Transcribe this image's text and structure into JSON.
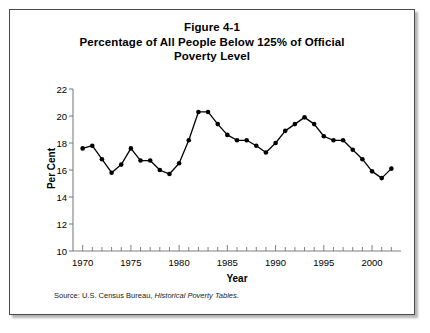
{
  "figure": {
    "title_lines": [
      "Figure 4-1",
      "Percentage of All People Below 125% of Official",
      "Poverty Level"
    ],
    "source_prefix": "Source: U.S. Census Bureau,",
    "source_italic": "Historical Poverty Tables",
    "source_suffix": "."
  },
  "chart_data": {
    "type": "line",
    "title": "Figure 4-1 Percentage of All People Below 125% of Official Poverty Level",
    "xlabel": "Year",
    "ylabel": "Per Cent",
    "xlim": [
      1969,
      2003
    ],
    "ylim": [
      10,
      22
    ],
    "ytick_step": 2,
    "yticks": [
      10,
      12,
      14,
      16,
      18,
      20,
      22
    ],
    "ytick_labels": [
      "10",
      "12",
      "14",
      "16",
      "18",
      "20",
      "22"
    ],
    "xticks_major": [
      1970,
      1975,
      1980,
      1985,
      1990,
      1995,
      2000
    ],
    "xtick_labels": [
      "1970",
      "1975",
      "1980",
      "1985",
      "1990",
      "1995",
      "2000"
    ],
    "xtick_minor_step": 1,
    "grid": false,
    "legend": false,
    "marker": "filled-circle",
    "line_color": "#000000",
    "marker_color": "#000000",
    "axis_color": "#808080",
    "x": [
      1970,
      1971,
      1972,
      1973,
      1974,
      1975,
      1976,
      1977,
      1978,
      1979,
      1980,
      1981,
      1982,
      1983,
      1984,
      1985,
      1986,
      1987,
      1988,
      1989,
      1990,
      1991,
      1992,
      1993,
      1994,
      1995,
      1996,
      1997,
      1998,
      1999,
      2000,
      2001,
      2002
    ],
    "values": [
      17.6,
      17.8,
      16.8,
      15.8,
      16.4,
      17.6,
      16.7,
      16.7,
      16.0,
      15.7,
      16.5,
      18.2,
      20.3,
      20.3,
      19.4,
      18.6,
      18.2,
      18.2,
      17.8,
      17.3,
      18.0,
      18.9,
      19.4,
      19.9,
      19.4,
      18.5,
      18.2,
      18.2,
      17.5,
      16.8,
      15.9,
      15.4,
      16.1
    ],
    "series": [
      {
        "name": "People Below 125% of Poverty Level",
        "values": [
          17.6,
          17.8,
          16.8,
          15.8,
          16.4,
          17.6,
          16.7,
          16.7,
          16.0,
          15.7,
          16.5,
          18.2,
          20.3,
          20.3,
          19.4,
          18.6,
          18.2,
          18.2,
          17.8,
          17.3,
          18.0,
          18.9,
          19.4,
          19.9,
          19.4,
          18.5,
          18.2,
          18.2,
          17.5,
          16.8,
          15.9,
          15.4,
          16.1
        ]
      }
    ]
  }
}
